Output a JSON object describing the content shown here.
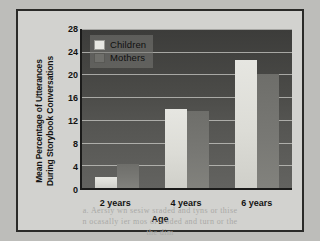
{
  "page": {
    "ghost_lines": [
      "a saecos aem dodn ae smeaaw sod",
      "a. Aersiy wn sesiw sraded and tyns or  thise",
      "n ocasally ier mos or traded and turn or  the",
      "the dim"
    ]
  },
  "chart_data": {
    "type": "bar",
    "title": "",
    "xlabel": "Age",
    "ylabel": "Mean Percentage of Utterances During Storybook Conversations",
    "categories": [
      "2 years",
      "4 years",
      "6 years"
    ],
    "series": [
      {
        "name": "Children",
        "values": [
          2,
          14,
          22.5
        ],
        "color": "#e6e6e1"
      },
      {
        "name": "Mothers",
        "values": [
          4.2,
          13.5,
          20
        ],
        "color": "#74746f"
      }
    ],
    "ylim": [
      0,
      28
    ],
    "yticks": [
      28,
      24,
      20,
      16,
      12,
      8,
      4,
      0
    ],
    "grid": true,
    "legend_position": "top-left",
    "plot_background": "#4b4b48",
    "gridline_color": "#cfcfca",
    "frame_border_color": "#2a2a28"
  }
}
